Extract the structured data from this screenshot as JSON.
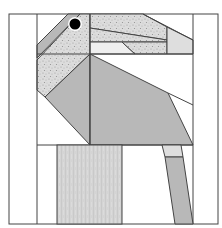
{
  "image": {
    "subject": "Geometric quilt block of a bird (flamingo/heron style)",
    "width": 222,
    "height": 228
  },
  "colors": {
    "background": "#ffffff",
    "stroke": "#444444",
    "gray_solid": "#b8b8b8",
    "gray_light": "#d9d9d9",
    "speckle_base": "#dcdcdc",
    "speckle_dot": "#9a9a9a",
    "linen_base": "#d4d4d4",
    "eye": "#000000"
  },
  "shapes": {
    "frame": {
      "x": 9,
      "y": 14,
      "w": 209,
      "h": 210
    },
    "eye": {
      "cx": 75,
      "cy": 24,
      "r": 6
    },
    "pieces": [
      {
        "name": "beak-stripe",
        "fill": "gray_solid"
      },
      {
        "name": "head-speckle",
        "fill": "speckle"
      },
      {
        "name": "neck-speckle",
        "fill": "speckle"
      },
      {
        "name": "body-left",
        "fill": "gray_solid"
      },
      {
        "name": "body-right",
        "fill": "gray_solid"
      },
      {
        "name": "tail-light",
        "fill": "gray_light"
      },
      {
        "name": "leg-texture",
        "fill": "linen"
      },
      {
        "name": "leg-light",
        "fill": "gray_light"
      },
      {
        "name": "leg-gray",
        "fill": "gray_solid"
      }
    ]
  },
  "caption": "Bird quilt block"
}
